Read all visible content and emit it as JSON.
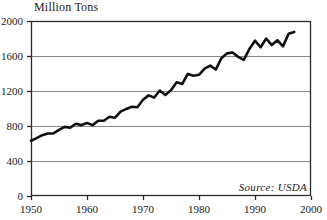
{
  "chart_data": {
    "type": "line",
    "title": "Million Tons",
    "xlabel": "",
    "ylabel": "Million Tons",
    "xlim": [
      1950,
      2000
    ],
    "ylim": [
      0,
      2000
    ],
    "grid": true,
    "legend_position": "none",
    "annotation": "Source:  USDA",
    "y_ticks": [
      0,
      400,
      800,
      1200,
      1600,
      2000
    ],
    "y_tick_labels": [
      "0",
      "400",
      "800",
      "1200",
      "1600",
      "2000"
    ],
    "x_ticks": [
      1950,
      1960,
      1970,
      1980,
      1990,
      2000
    ],
    "x_tick_labels": [
      "1950",
      "1960",
      "1970",
      "1980",
      "1990",
      "2000"
    ],
    "series": [
      {
        "name": "World Grain Production",
        "x": [
          1950,
          1951,
          1952,
          1953,
          1954,
          1955,
          1956,
          1957,
          1958,
          1959,
          1960,
          1961,
          1962,
          1963,
          1964,
          1965,
          1966,
          1967,
          1968,
          1969,
          1970,
          1971,
          1972,
          1973,
          1974,
          1975,
          1976,
          1977,
          1978,
          1979,
          1980,
          1981,
          1982,
          1983,
          1984,
          1985,
          1986,
          1987,
          1988,
          1989,
          1990,
          1991,
          1992,
          1993,
          1994,
          1995,
          1996,
          1997
        ],
        "values": [
          631,
          662,
          695,
          715,
          715,
          755,
          790,
          780,
          825,
          810,
          835,
          810,
          860,
          860,
          905,
          895,
          965,
          995,
          1020,
          1015,
          1100,
          1150,
          1125,
          1205,
          1155,
          1210,
          1300,
          1280,
          1395,
          1375,
          1385,
          1455,
          1490,
          1445,
          1575,
          1630,
          1640,
          1590,
          1555,
          1680,
          1775,
          1700,
          1800,
          1725,
          1780,
          1710,
          1855,
          1875
        ]
      }
    ]
  },
  "plot_geometry": {
    "left": 31,
    "top": 21,
    "right": 311,
    "bottom": 196
  }
}
